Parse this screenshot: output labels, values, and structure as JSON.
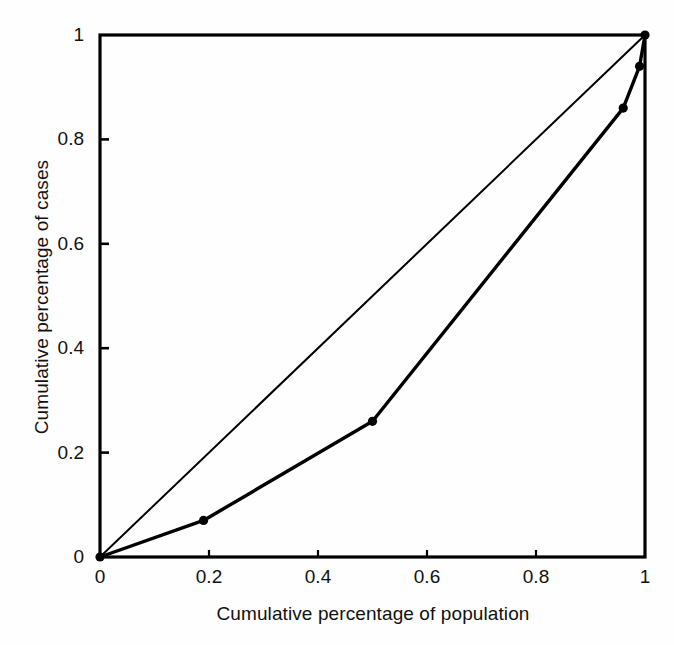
{
  "chart_data": {
    "type": "line",
    "title": "",
    "xlabel": "Cumulative percentage of population",
    "ylabel": "Cumulative percentage of cases",
    "xlim": [
      0,
      1
    ],
    "ylim": [
      0,
      1
    ],
    "grid": false,
    "legend": null,
    "xticks": [
      "0",
      "0.2",
      "0.4",
      "0.6",
      "0.8",
      "1"
    ],
    "xtick_values": [
      0,
      0.2,
      0.4,
      0.6,
      0.8,
      1
    ],
    "yticks": [
      "0",
      "0.2",
      "0.4",
      "0.6",
      "0.8",
      "1"
    ],
    "ytick_values": [
      0,
      0.2,
      0.4,
      0.6,
      0.8,
      1
    ],
    "series": [
      {
        "name": "Line of equality",
        "style": "thin-line",
        "markers": false,
        "x": [
          0,
          1
        ],
        "y": [
          0,
          1
        ]
      },
      {
        "name": "Lorenz curve",
        "style": "thick-line",
        "markers": true,
        "x": [
          0,
          0.19,
          0.5,
          0.96,
          0.99,
          1
        ],
        "y": [
          0,
          0.07,
          0.26,
          0.86,
          0.94,
          1
        ]
      }
    ]
  },
  "axes": {
    "frame_color": "#000000",
    "line_color": "#000000",
    "background": "#fefefe"
  }
}
